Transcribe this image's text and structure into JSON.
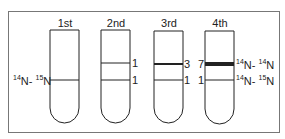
{
  "diagram": {
    "type": "density-gradient-centrifugation-tubes",
    "generations": [
      {
        "label": "1st",
        "bands": [
          {
            "position": "lower",
            "count": "",
            "thickness": "thin"
          }
        ]
      },
      {
        "label": "2nd",
        "bands": [
          {
            "position": "upper",
            "count": "1",
            "thickness": "thin"
          },
          {
            "position": "lower",
            "count": "1",
            "thickness": "thin"
          }
        ]
      },
      {
        "label": "3rd",
        "bands": [
          {
            "position": "upper",
            "count": "3",
            "thickness": "medium"
          },
          {
            "position": "lower",
            "count": "1",
            "thickness": "thin"
          }
        ]
      },
      {
        "label": "4th",
        "bands": [
          {
            "position": "upper",
            "count": "7",
            "thickness": "thick"
          },
          {
            "position": "lower",
            "count": "1",
            "thickness": "thin"
          }
        ]
      }
    ],
    "labels": {
      "left_hybrid": {
        "a_mass": "14",
        "a_sym": "N",
        "sep": "-",
        "b_mass": "15",
        "b_sym": "N"
      },
      "right_light": {
        "a_mass": "14",
        "a_sym": "N",
        "sep": "-",
        "b_mass": "14",
        "b_sym": "N"
      },
      "right_hybrid": {
        "a_mass": "14",
        "a_sym": "N",
        "sep": "-",
        "b_mass": "15",
        "b_sym": "N"
      }
    }
  }
}
